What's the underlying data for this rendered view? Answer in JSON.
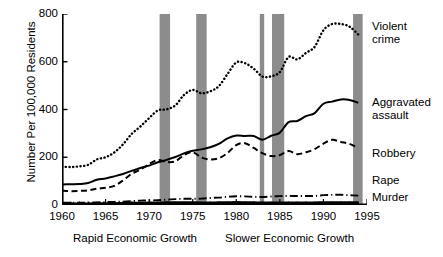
{
  "chart_data": {
    "type": "line",
    "title": "",
    "xlabel": "",
    "ylabel": "Number Per 100,000 Residents",
    "xlim": [
      1960,
      1995
    ],
    "ylim": [
      0,
      800
    ],
    "grid": false,
    "legend_position": "right-inline",
    "xticks": [
      1960,
      1965,
      1970,
      1975,
      1980,
      1985,
      1990,
      1995
    ],
    "xtick_labels": [
      "1960",
      "1965",
      "1970",
      "1975",
      "1980",
      "1985",
      "1990",
      "1995"
    ],
    "yticks": [
      0,
      200,
      400,
      600,
      800
    ],
    "ytick_labels": [
      "0",
      "200",
      "400",
      "600",
      "800"
    ],
    "minor_xtick_interval": 1,
    "x": [
      1960,
      1961,
      1962,
      1963,
      1964,
      1965,
      1966,
      1967,
      1968,
      1969,
      1970,
      1971,
      1972,
      1973,
      1974,
      1975,
      1976,
      1977,
      1978,
      1979,
      1980,
      1981,
      1982,
      1983,
      1984,
      1985,
      1986,
      1987,
      1988,
      1989,
      1990,
      1991,
      1992,
      1993,
      1994
    ],
    "series": [
      {
        "name": "Violent crime",
        "label": "Violent\ncrime",
        "style": "dotted",
        "color": "#000000",
        "values": [
          161,
          159,
          162,
          168,
          191,
          200,
          220,
          254,
          298,
          329,
          364,
          396,
          401,
          417,
          461,
          482,
          468,
          476,
          498,
          549,
          597,
          594,
          571,
          538,
          539,
          557,
          620,
          610,
          637,
          663,
          732,
          758,
          758,
          747,
          714
        ]
      },
      {
        "name": "Aggravated assault",
        "label": "Aggravated\nassault",
        "style": "solid",
        "color": "#000000",
        "values": [
          86,
          87,
          88,
          92,
          106,
          111,
          120,
          130,
          143,
          155,
          165,
          179,
          189,
          201,
          216,
          227,
          233,
          242,
          256,
          279,
          291,
          289,
          289,
          273,
          290,
          303,
          347,
          352,
          372,
          385,
          424,
          433,
          442,
          440,
          428
        ]
      },
      {
        "name": "Robbery",
        "label": "Robbery",
        "style": "dashed",
        "color": "#000000",
        "values": [
          60,
          58,
          59,
          61,
          68,
          72,
          80,
          103,
          131,
          148,
          172,
          188,
          180,
          183,
          209,
          221,
          199,
          191,
          196,
          218,
          251,
          259,
          239,
          217,
          205,
          209,
          226,
          213,
          221,
          234,
          257,
          273,
          264,
          256,
          238
        ]
      },
      {
        "name": "Rape",
        "label": "Rape",
        "style": "dashdot",
        "color": "#000000",
        "values": [
          9.6,
          9.4,
          9.4,
          9.4,
          11.2,
          12.1,
          13.2,
          14.0,
          15.9,
          18.5,
          18.7,
          20.5,
          22.5,
          24.5,
          26.2,
          26.3,
          26.6,
          29.4,
          31.0,
          34.7,
          36.8,
          36.0,
          34.0,
          33.7,
          35.7,
          37.1,
          38.1,
          37.6,
          37.6,
          38.1,
          41.2,
          42.3,
          42.8,
          41.1,
          39.2
        ]
      },
      {
        "name": "Murder",
        "label": "Murder",
        "style": "thick-solid",
        "color": "#000000",
        "values": [
          5.1,
          4.8,
          4.6,
          4.6,
          4.9,
          5.1,
          5.6,
          6.2,
          6.9,
          7.3,
          7.9,
          8.6,
          9.0,
          9.4,
          9.8,
          9.6,
          8.8,
          8.8,
          9.0,
          9.7,
          10.2,
          9.8,
          9.1,
          8.3,
          7.9,
          8.0,
          8.6,
          8.3,
          8.4,
          8.7,
          9.4,
          9.8,
          9.3,
          9.5,
          9.0
        ]
      }
    ],
    "shaded_bands": {
      "label": "recession-band",
      "color": "#8c8c8c",
      "ranges": [
        [
          1971.2,
          1972.4
        ],
        [
          1975.4,
          1976.6
        ],
        [
          1982.7,
          1983.2
        ],
        [
          1984.1,
          1985.5
        ],
        [
          1993.4,
          1994.5
        ]
      ]
    },
    "annotations": [
      {
        "name": "rapid-growth-note",
        "text": "Rapid Economic Growth"
      },
      {
        "name": "slower-growth-note",
        "text": "Slower Economic Growth"
      }
    ]
  }
}
